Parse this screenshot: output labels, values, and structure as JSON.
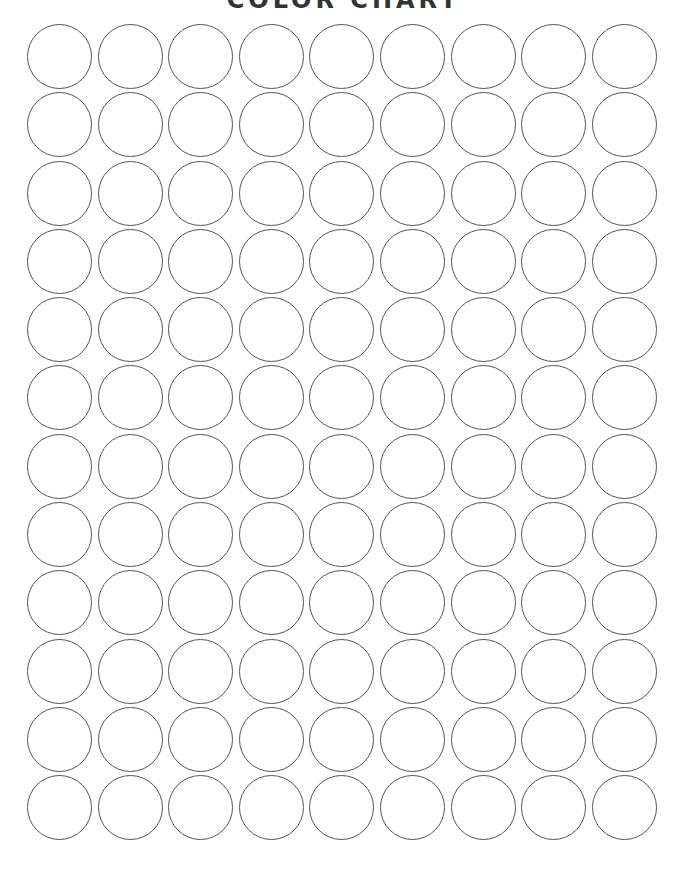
{
  "title": "COLOR CHART",
  "grid": {
    "rows": 12,
    "columns": 9,
    "swatch_shape": "circle",
    "swatch_fill": "#ffffff",
    "swatch_stroke": "#555555"
  }
}
